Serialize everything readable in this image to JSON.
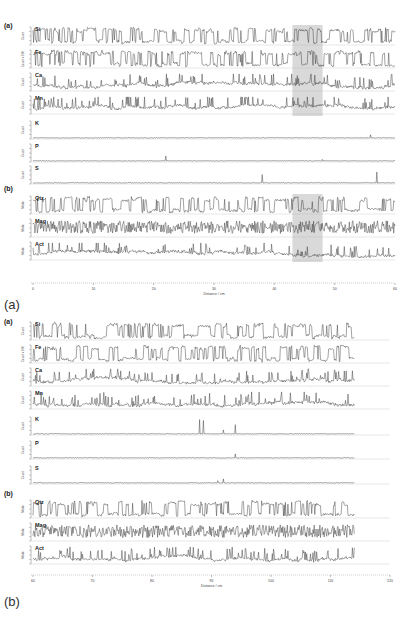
{
  "figure": {
    "caption_a": "(a)",
    "caption_b": "(b)"
  },
  "chart_data": [
    {
      "type": "line",
      "title": "(a) 0–60 cm",
      "xlabel": "Distance / cm",
      "x_ticks": [
        0,
        10,
        20,
        30,
        40,
        50,
        60
      ],
      "xlim": [
        0,
        60
      ],
      "grid": false,
      "highlight_region": {
        "x_start": 43,
        "x_end": 48,
        "color": "#d9d9d9"
      },
      "group_labels": {
        "elements": "(a)",
        "minerals": "(b)"
      },
      "series": [
        {
          "name": "Si",
          "group": "elements",
          "ylabel": "Count",
          "ylim": [
            0,
            20
          ],
          "pattern": "square-ish high amplitude"
        },
        {
          "name": "Fe",
          "group": "elements",
          "ylabel": "Count x 100",
          "ylim": [
            0,
            15
          ],
          "pattern": "square-ish high amplitude"
        },
        {
          "name": "Ca",
          "group": "elements",
          "ylabel": "Count",
          "ylim": [
            0,
            15
          ],
          "pattern": "moderate spiky"
        },
        {
          "name": "Mn",
          "group": "elements",
          "ylabel": "Count",
          "ylim": [
            0,
            15
          ],
          "pattern": "moderate spiky"
        },
        {
          "name": "K",
          "group": "elements",
          "ylabel": "Count",
          "ylim": [
            0,
            30
          ],
          "pattern": "near baseline, small peak ~56 cm"
        },
        {
          "name": "P",
          "group": "elements",
          "ylabel": "Count",
          "ylim": [
            0,
            8
          ],
          "pattern": "near baseline, small peak ~22 cm"
        },
        {
          "name": "S",
          "group": "elements",
          "ylabel": "Count",
          "ylim": [
            0,
            8
          ],
          "pattern": "near baseline, spikes ~38 and ~57 cm"
        },
        {
          "name": "Qtz",
          "group": "minerals",
          "ylabel": "Mode",
          "ylim": [
            0,
            1
          ],
          "pattern": "square-ish high amplitude"
        },
        {
          "name": "Mag",
          "group": "minerals",
          "ylabel": "Mode",
          "ylim": [
            0,
            1
          ],
          "pattern": "dense oscillation"
        },
        {
          "name": "Act",
          "group": "minerals",
          "ylabel": "Mode",
          "ylim": [
            0,
            1
          ],
          "pattern": "moderate spiky"
        }
      ]
    },
    {
      "type": "line",
      "title": "(b) 60–120 cm",
      "xlabel": "Distance / cm",
      "x_ticks": [
        60,
        70,
        80,
        90,
        100,
        110,
        120
      ],
      "xlim": [
        60,
        120
      ],
      "data_extent": [
        60,
        114
      ],
      "grid": false,
      "group_labels": {
        "elements": "(a)",
        "minerals": "(b)"
      },
      "series": [
        {
          "name": "Si",
          "group": "elements",
          "ylabel": "Count",
          "ylim": [
            0,
            20
          ],
          "pattern": "square-ish high amplitude"
        },
        {
          "name": "Fe",
          "group": "elements",
          "ylabel": "Count x 100",
          "ylim": [
            0,
            15
          ],
          "pattern": "square-ish high amplitude"
        },
        {
          "name": "Ca",
          "group": "elements",
          "ylabel": "Count",
          "ylim": [
            0,
            15
          ],
          "pattern": "moderate spiky"
        },
        {
          "name": "Mn",
          "group": "elements",
          "ylabel": "Count",
          "ylim": [
            0,
            15
          ],
          "pattern": "moderate spiky, peak ~87 cm"
        },
        {
          "name": "K",
          "group": "elements",
          "ylabel": "Count",
          "ylim": [
            0,
            30
          ],
          "pattern": "baseline, peaks ~88, ~92, ~94 cm"
        },
        {
          "name": "P",
          "group": "elements",
          "ylabel": "Count",
          "ylim": [
            0,
            8
          ],
          "pattern": "near baseline, bump ~94 cm"
        },
        {
          "name": "S",
          "group": "elements",
          "ylabel": "Count",
          "ylim": [
            0,
            8
          ],
          "pattern": "near baseline, bump ~92 cm"
        },
        {
          "name": "Qtz",
          "group": "minerals",
          "ylabel": "Mode",
          "ylim": [
            0,
            1
          ],
          "pattern": "square-ish high amplitude"
        },
        {
          "name": "Mag",
          "group": "minerals",
          "ylabel": "Mode",
          "ylim": [
            0,
            1
          ],
          "pattern": "dense oscillation"
        },
        {
          "name": "Act",
          "group": "minerals",
          "ylabel": "Mode",
          "ylim": [
            0,
            1
          ],
          "pattern": "moderate spiky"
        }
      ]
    }
  ]
}
